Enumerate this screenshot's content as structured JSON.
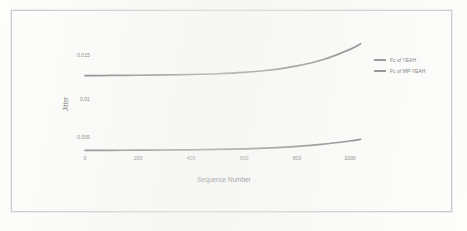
{
  "figure": {
    "border_color": "#c9c9c9",
    "background_color": "#fdfdfc"
  },
  "chart_data": {
    "type": "line",
    "title": "",
    "xlabel": "Sequence Number",
    "ylabel": "Jitter",
    "xlim": [
      0,
      1050
    ],
    "ylim": [
      0.0035,
      0.0195
    ],
    "xticks": [
      0,
      200,
      400,
      600,
      800,
      1000
    ],
    "xtick_labels": [
      "0",
      "200",
      "400",
      "600",
      "800",
      "1000"
    ],
    "yticks": [
      0.005,
      0.01,
      0.015
    ],
    "ytick_labels": [
      "0.005",
      "0.01",
      "0.015"
    ],
    "grid": false,
    "legend_position": "right",
    "line_color": "#7a7a7a",
    "series": [
      {
        "name": "Fc of YEAH",
        "color": "#7a7a7a",
        "x": [
          0,
          100,
          200,
          300,
          400,
          500,
          600,
          700,
          800,
          900,
          1000,
          1040
        ],
        "values": [
          0.01425,
          0.01427,
          0.0143,
          0.01434,
          0.0144,
          0.0145,
          0.01468,
          0.015,
          0.01555,
          0.0164,
          0.01775,
          0.0185
        ]
      },
      {
        "name": "Fc of MP-YEAH",
        "color": "#7a7a7a",
        "x": [
          0,
          100,
          200,
          300,
          400,
          500,
          600,
          700,
          800,
          900,
          1000,
          1040
        ],
        "values": [
          0.00428,
          0.00429,
          0.00431,
          0.00433,
          0.00436,
          0.00441,
          0.00449,
          0.00462,
          0.00482,
          0.00512,
          0.00553,
          0.00575
        ]
      }
    ]
  },
  "legend": {
    "items": [
      {
        "label": "Fc of YEAH"
      },
      {
        "label": "Fc of MP-YEAH"
      }
    ]
  },
  "axes": {
    "x_title": "Sequence Number",
    "y_title": "Jitter",
    "x_tick_labels": [
      "0",
      "200",
      "400",
      "600",
      "800",
      "1000"
    ],
    "y_tick_labels": [
      "0.015",
      "0.01",
      "0.005"
    ]
  }
}
